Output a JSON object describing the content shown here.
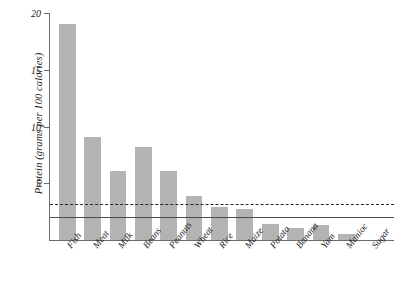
{
  "chart_data": {
    "type": "bar",
    "title": "",
    "xlabel": "",
    "ylabel": "Protein (grams per 100 calories)",
    "ylim": [
      0,
      20
    ],
    "yticks": [
      5,
      10,
      15,
      20
    ],
    "ytick_labels": [
      "5",
      "10",
      "15",
      "20"
    ],
    "grid": false,
    "legend": "none",
    "bar_color": "#b3b3b3",
    "categories": [
      "Fish",
      "Meat",
      "Milk",
      "Beans",
      "Peanuts",
      "Wheat",
      "Rice",
      "Maize",
      "Potato",
      "Banana",
      "Yam",
      "Manioc",
      "Sugar"
    ],
    "values": [
      19.0,
      9.1,
      6.1,
      8.2,
      6.1,
      3.9,
      2.9,
      2.7,
      1.4,
      1.1,
      1.3,
      0.5,
      0.0
    ],
    "annotations": [
      {
        "name": "upper-reference-line",
        "type": "hline",
        "style": "dashed",
        "value": 3.2,
        "color": "#262626"
      },
      {
        "name": "lower-reference-line",
        "type": "hline",
        "style": "solid",
        "value": 2.0,
        "color": "#4d4d4d"
      }
    ]
  }
}
